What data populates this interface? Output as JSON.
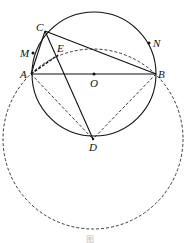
{
  "diagram": {
    "type": "geometry",
    "points": {
      "A": {
        "label": "A",
        "x": 31,
        "y": 74
      },
      "B": {
        "label": "B",
        "x": 156,
        "y": 74
      },
      "O": {
        "label": "O",
        "x": 94,
        "y": 74
      },
      "C": {
        "label": "C",
        "x": 45,
        "y": 31
      },
      "D": {
        "label": "D",
        "x": 93,
        "y": 139
      },
      "E": {
        "label": "E",
        "x": 58,
        "y": 55
      },
      "M": {
        "label": "M",
        "x": 33,
        "y": 53
      },
      "N": {
        "label": "N",
        "x": 149,
        "y": 43
      }
    },
    "circles": [
      {
        "name": "circle-O",
        "center": "O",
        "radius": 62,
        "style": "solid"
      },
      {
        "name": "circle-D",
        "center": "D",
        "radius": 90,
        "style": "dashed"
      }
    ],
    "segments_solid": [
      "AB",
      "AC",
      "BC",
      "CD"
    ],
    "segments_dashed": [
      "AD",
      "BD",
      "AE"
    ],
    "caption": "图"
  }
}
